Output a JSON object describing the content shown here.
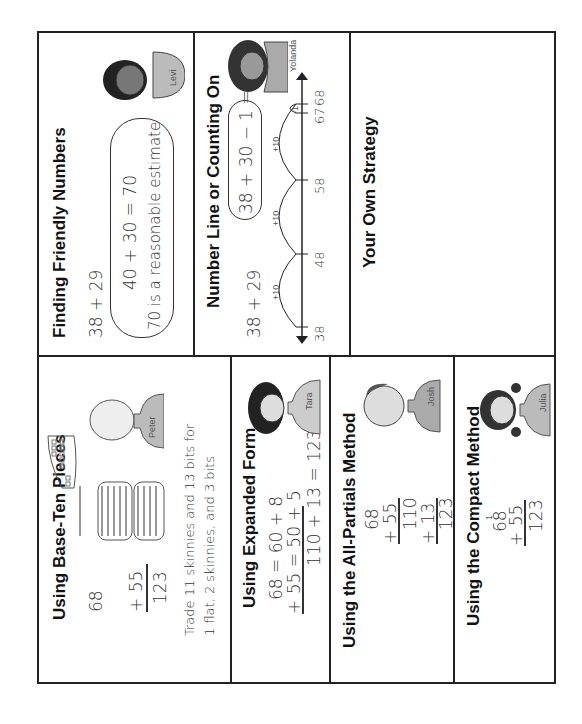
{
  "sections": {
    "friendly": {
      "title": "Finding Friendly Numbers",
      "problem": "38 + 29",
      "cloud_line1": "40 + 30 = 70",
      "cloud_line2": "70 is a reasonable estimate",
      "character": "Levi"
    },
    "number_line": {
      "title": "Number Line or Counting On",
      "problem": "38 + 29",
      "cloud": "38 + 30 − 1 = 67",
      "character": "Yolanda",
      "ticks": [
        "38",
        "48",
        "58",
        "67",
        "68"
      ],
      "jumps": [
        "+10",
        "+10",
        "+10",
        "-1"
      ]
    },
    "own": {
      "title": "Your Own Strategy"
    },
    "base_ten": {
      "title": "Using Base-Ten Pieces",
      "top": "68",
      "addend": "+ 55",
      "sum": "123",
      "note_line1": "Trade 11 skinnies and 13 bits for",
      "note_line2": "1 flat, 2 skinnies, and 3 bits",
      "character": "Peter"
    },
    "expanded": {
      "title": "Using Expanded Form",
      "line1": "68 = 60 + 8",
      "line2": "+ 55 = 50 + 5",
      "line3": "110 + 13 = 123",
      "character": "Tara"
    },
    "partials": {
      "title": "Using the All-Partials Method",
      "n1": "68",
      "n2": "+ 55",
      "p1": "110",
      "p2": "+ 13",
      "sum": "123",
      "character": "Josh"
    },
    "compact": {
      "title": "Using the Compact Method",
      "carry": "1",
      "n1": "68",
      "n2": "+ 55",
      "sum": "123",
      "character": "Julia"
    }
  }
}
